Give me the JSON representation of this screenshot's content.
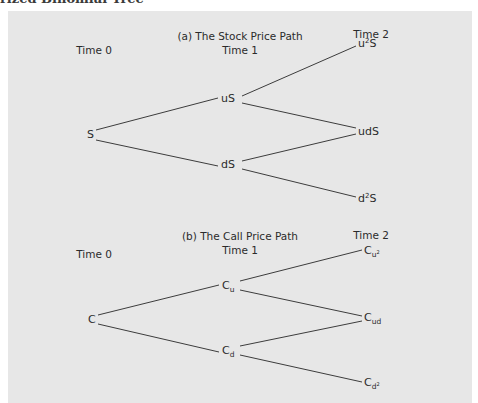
{
  "header": {
    "clipped_text": "rized Binomial Tree"
  },
  "colors": {
    "panel_bg": "#e7e7e7",
    "line": "#3c3c3c",
    "text": "#2b2b2b"
  },
  "panel_a": {
    "title": "(a) The Stock Price Path",
    "time_labels": [
      "Time 0",
      "Time 1",
      "Time 2"
    ],
    "nodes": {
      "t0": "S",
      "t1_up": "uS",
      "t1_down": "dS",
      "t2_uu_base": "u",
      "t2_uu_exp": "2",
      "t2_uu_tail": "S",
      "t2_ud": "udS",
      "t2_dd_base": "d",
      "t2_dd_exp": "2",
      "t2_dd_tail": "S"
    }
  },
  "panel_b": {
    "title": "(b) The Call Price Path",
    "time_labels": [
      "Time 0",
      "Time 1",
      "Time 2"
    ],
    "nodes": {
      "t0": "C",
      "t1_up_base": "C",
      "t1_up_sub": "u",
      "t1_down_base": "C",
      "t1_down_sub": "d",
      "t2_uu_base": "C",
      "t2_uu_sub": "u",
      "t2_uu_sup": "2",
      "t2_ud_base": "C",
      "t2_ud_sub": "ud",
      "t2_dd_base": "C",
      "t2_dd_sub": "d",
      "t2_dd_sup": "2"
    }
  }
}
